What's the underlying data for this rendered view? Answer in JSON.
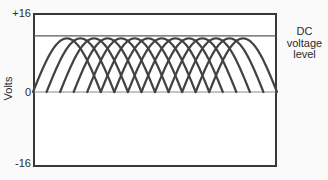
{
  "figure": {
    "ylabel": "Volts",
    "ytick_top": "+16",
    "ytick_zero": "0",
    "ytick_bottom": "-16",
    "dc_label_lines": [
      "DC",
      "voltage",
      "level"
    ]
  },
  "colors": {
    "trace": "#424242",
    "frame": "#383838",
    "dc_line": "#5a5a5a",
    "zero_line": "#8c8c8c",
    "text": "#2b2b2b",
    "background": "#fafafa"
  },
  "chart_data": {
    "type": "line",
    "title": "",
    "xlabel": "",
    "ylabel": "Volts",
    "ylim": [
      -16,
      16
    ],
    "y_ticks": [
      16,
      0,
      -16
    ],
    "y_tick_labels": [
      "+16",
      "0",
      "-16"
    ],
    "grid": false,
    "legend": null,
    "annotations": [
      "DC voltage level"
    ],
    "dc_voltage_level_volts": 11.5,
    "waveform": {
      "kind": "overlapping-half-sine-rectified-lobes",
      "description": "Fourteen identical half-sine voltage lobes, evenly phase-shifted so five overlap at any instant; their common peak envelope sits just under the DC voltage level line",
      "lobe_count": 14,
      "lobe_peak_volts": 11,
      "lobe_half_period_t": 5,
      "lobe_peaks_t": [
        0,
        1,
        2,
        3,
        4,
        5,
        6,
        7,
        8,
        9,
        10,
        11,
        12,
        13
      ],
      "t_range": [
        -2.5,
        15.5
      ]
    }
  }
}
